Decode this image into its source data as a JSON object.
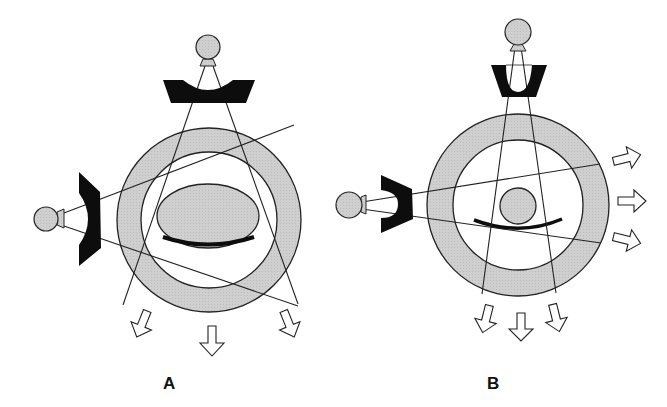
{
  "figure": {
    "panels": [
      {
        "id": "A",
        "label": "A",
        "description": "Parallel-hole style collimators, elliptical phantom with curved table; radiation escapes downward",
        "object_shape": "ellipse"
      },
      {
        "id": "B",
        "label": "B",
        "description": "Converging/fan collimators closer to sources, circular phantom with curved table; radiation escapes right and downward",
        "object_shape": "circle"
      }
    ],
    "colors": {
      "fill_gray": "#cfcfcf",
      "stroke": "#222222",
      "collimator": "#0d0d0d",
      "background": "#ffffff"
    }
  }
}
